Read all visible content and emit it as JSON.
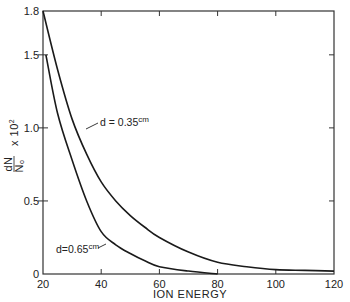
{
  "chart_data": {
    "type": "line",
    "title": "",
    "xlabel": "ION ENERGY",
    "ylabel": "dN/N₀ x 10²",
    "xlim": [
      20,
      120
    ],
    "ylim": [
      0,
      1.8
    ],
    "x_ticks": [
      20,
      40,
      60,
      80,
      100,
      120
    ],
    "y_ticks": [
      0,
      0.5,
      1.0,
      1.5,
      1.8
    ],
    "x_tick_labels": [
      "20",
      "40",
      "60",
      "80",
      "100",
      "120"
    ],
    "y_tick_labels": [
      "0",
      "0.5",
      "1.0",
      "1.5",
      "1.8"
    ],
    "grid": false,
    "legend": "none (inline annotations)",
    "series": [
      {
        "name": "d = 0.35 cm",
        "x": [
          20,
          25,
          30,
          35,
          40,
          45,
          50,
          55,
          60,
          70,
          80,
          90,
          100,
          110,
          120
        ],
        "y": [
          1.8,
          1.4,
          1.06,
          0.82,
          0.63,
          0.5,
          0.4,
          0.32,
          0.25,
          0.15,
          0.08,
          0.05,
          0.03,
          0.025,
          0.02
        ]
      },
      {
        "name": "d = 0.65 cm",
        "x": [
          21,
          25,
          30,
          35,
          40,
          45,
          50,
          55,
          60,
          70,
          80
        ],
        "y": [
          1.5,
          1.1,
          0.78,
          0.5,
          0.29,
          0.2,
          0.14,
          0.09,
          0.05,
          0.02,
          0.0
        ]
      }
    ],
    "annotations": [
      {
        "text": "d = 0.35",
        "sup": "cm",
        "target_series": "d = 0.35 cm"
      },
      {
        "text": "d=0.65",
        "sup": "cm",
        "target_series": "d = 0.65 cm"
      }
    ]
  },
  "labels": {
    "xlabel": "ION ENERGY",
    "ylabel_num": "dN",
    "ylabel_den": "N",
    "ylabel_den_sub": "o",
    "ylabel_mult": "x 10",
    "ylabel_exp": "2",
    "annot1_text": "d = 0.35",
    "annot1_sup": "cm",
    "annot2_text": "d=0.65",
    "annot2_sup": "cm"
  },
  "colors": {
    "line": "#1a1a1a",
    "axis": "#333333",
    "background": "#ffffff"
  }
}
